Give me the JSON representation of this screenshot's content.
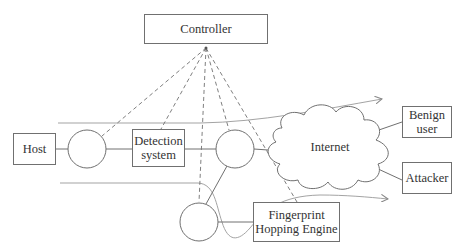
{
  "diagram": {
    "nodes": {
      "controller": {
        "label": "Controller"
      },
      "host": {
        "label": "Host"
      },
      "detection": {
        "line1": "Detection",
        "line2": "system"
      },
      "internet": {
        "label": "Internet"
      },
      "benign": {
        "line1": "Benign",
        "line2": "user"
      },
      "attacker": {
        "label": "Attacker"
      },
      "fhe": {
        "line1": "Fingerprint",
        "line2": "Hopping Engine"
      }
    },
    "switches": [
      "switch-1",
      "switch-2",
      "switch-3"
    ],
    "edges": {
      "solid": [
        "host-switch1",
        "switch1-detection",
        "detection-switch2",
        "switch2-internet",
        "switch2-switch3",
        "switch3-fhe",
        "internet-benign",
        "internet-attacker"
      ],
      "dashed_from_controller": [
        "switch1",
        "detection",
        "switch3",
        "switch2",
        "fhe"
      ],
      "flow_arrows": [
        "top-flow (host side to beyond internet)",
        "bottom-flow (detour via switch3 toward fhe)"
      ]
    },
    "colors": {
      "stroke": "#707070",
      "dash": "#707070",
      "text": "#333333"
    }
  }
}
